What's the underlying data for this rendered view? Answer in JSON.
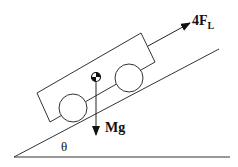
{
  "diagram": {
    "labels": {
      "force_lift": "4F",
      "force_lift_subscript": "L",
      "weight": "Mg",
      "angle": "θ"
    },
    "elements": [
      "ground",
      "incline",
      "car-body",
      "front-wheel",
      "rear-wheel",
      "center-of-mass",
      "lift-force-arrow",
      "weight-arrow"
    ],
    "colors": {
      "stroke": "#222222",
      "background": "#ffffff"
    }
  }
}
